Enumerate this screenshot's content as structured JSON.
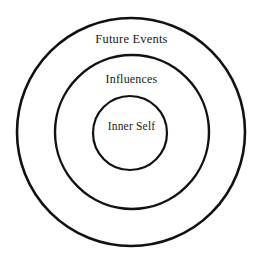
{
  "diagram": {
    "type": "concentric-circles",
    "title": "",
    "background_color": "#ffffff",
    "stroke_color": "#111111",
    "text_color": "#1a1a1a",
    "rings": [
      {
        "id": "future-events",
        "label": "Future Events",
        "level": 3,
        "center_x": 131,
        "center_y": 132,
        "radius": 114,
        "stroke_width": 2.6,
        "fill": "none"
      },
      {
        "id": "influences",
        "label": "Influences",
        "level": 2,
        "center_x": 132,
        "center_y": 132,
        "radius": 77,
        "stroke_width": 2.4,
        "fill": "none"
      },
      {
        "id": "inner-self",
        "label": "Inner Self",
        "level": 1,
        "center_x": 130,
        "center_y": 133,
        "radius": 37,
        "stroke_width": 2.2,
        "fill": "none"
      }
    ]
  }
}
